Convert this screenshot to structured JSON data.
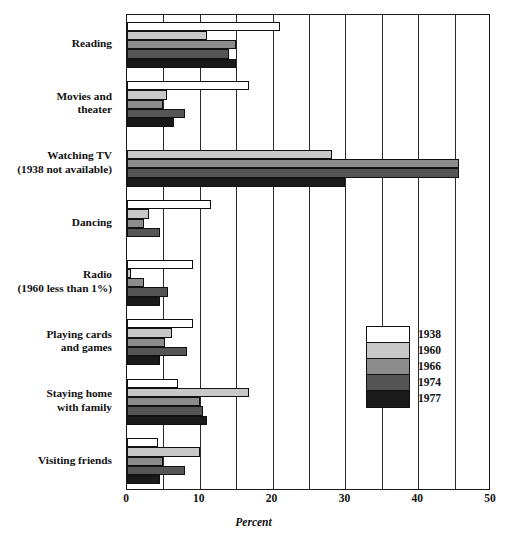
{
  "chart_data": {
    "type": "bar",
    "orientation": "horizontal",
    "title": "",
    "xlabel": "Percent",
    "ylabel": "",
    "xlim": [
      0,
      50
    ],
    "xticks": [
      0,
      10,
      20,
      30,
      40,
      50
    ],
    "xtick_labels": [
      "0",
      "10",
      "20",
      "30",
      "40",
      "50"
    ],
    "gridline_step": 5,
    "grid": true,
    "legend_position": "inside-right",
    "categories": [
      "Reading",
      "Movies and theater",
      "Watching TV (1938 not available)",
      "Dancing",
      "Radio (1960 less than 1%)",
      "Playing cards and games",
      "Staying home with family",
      "Visiting friends"
    ],
    "category_labels": [
      [
        "Reading"
      ],
      [
        "Movies and",
        "theater"
      ],
      [
        "Watching TV",
        "(1938 not available)"
      ],
      [
        "Dancing"
      ],
      [
        "Radio",
        "(1960 less than 1%)"
      ],
      [
        "Playing cards",
        "and games"
      ],
      [
        "Staying home",
        "with family"
      ],
      [
        "Visiting friends"
      ]
    ],
    "series": [
      {
        "name": "1938",
        "color": "#ffffff",
        "values": [
          21.0,
          16.8,
          null,
          11.5,
          9.0,
          9.0,
          7.0,
          4.2
        ]
      },
      {
        "name": "1960",
        "color": "#c8c8c8",
        "values": [
          11.0,
          5.5,
          28.2,
          3.0,
          0.5,
          6.2,
          16.8,
          10.0
        ]
      },
      {
        "name": "1966",
        "color": "#8c8c8c",
        "values": [
          15.0,
          5.0,
          45.6,
          2.4,
          2.4,
          5.2,
          10.0,
          5.0
        ]
      },
      {
        "name": "1974",
        "color": "#555555",
        "values": [
          14.0,
          8.0,
          45.6,
          4.6,
          5.6,
          8.2,
          10.4,
          8.0
        ]
      },
      {
        "name": "1977",
        "color": "#1a1a1a",
        "values": [
          15.0,
          6.4,
          30.0,
          0.0,
          4.5,
          4.6,
          11.0,
          4.5
        ]
      }
    ],
    "annotations": []
  },
  "legend": {
    "entries": [
      {
        "label": "1938",
        "color": "#ffffff"
      },
      {
        "label": "1960",
        "color": "#c8c8c8"
      },
      {
        "label": "1966",
        "color": "#8c8c8c"
      },
      {
        "label": "1974",
        "color": "#555555"
      },
      {
        "label": "1977",
        "color": "#1a1a1a"
      }
    ]
  },
  "axis": {
    "x_title": "Percent",
    "ticks": [
      "0",
      "10",
      "20",
      "30",
      "40",
      "50"
    ]
  },
  "colors": {
    "frame": "#1a1a1a",
    "grid": "#2a2a2a",
    "text": "#111111",
    "background": "#ffffff"
  }
}
